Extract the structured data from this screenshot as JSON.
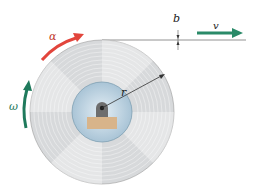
{
  "diagram": {
    "labels": {
      "alpha": "α",
      "omega": "ω",
      "radius": "r",
      "thickness": "b",
      "velocity": "v"
    },
    "colors": {
      "alpha_arrow": "#e2453c",
      "omega_arrow": "#1f7a5c",
      "velocity_arrow": "#2a8a68",
      "disc": "#d4d6d8",
      "hub": "#bcd3e2",
      "base": "#d8b48a",
      "line": "#6a6a6a"
    }
  }
}
